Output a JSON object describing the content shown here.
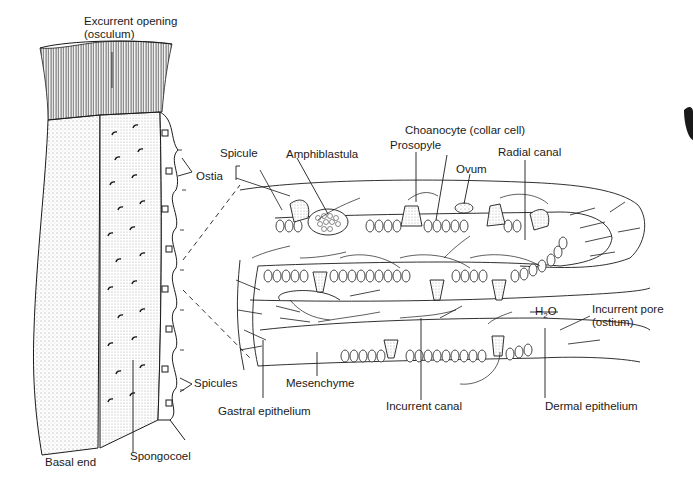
{
  "figure": {
    "left_panel": "External and cutaway view of sponge body",
    "right_panel": "Enlarged section of body wall showing canal system"
  },
  "labels": {
    "excurrent_opening": "Excurrent opening\n(osculum)",
    "ostia": "Ostia",
    "spicules": "Spicules",
    "spongocoel": "Spongocoel",
    "basal_end": "Basal end",
    "spicule": "Spicule",
    "amphiblastula": "Amphiblastula",
    "prosopyle": "Prosopyle",
    "choanocyte": "Choanocyte (collar cell)",
    "ovum": "Ovum",
    "radial_canal": "Radial canal",
    "h2o_prefix": "H",
    "h2o_sub": "2",
    "h2o_suffix": "O",
    "incurrent_pore": "Incurrent pore\n(ostium)",
    "mesenchyme": "Mesenchyme",
    "gastral_epithelium": "Gastral epithelium",
    "incurrent_canal": "Incurrent canal",
    "dermal_epithelium": "Dermal epithelium"
  },
  "colors": {
    "ink": "#1a1a1a",
    "stipple": "#9a9a9a",
    "background": "#ffffff"
  }
}
